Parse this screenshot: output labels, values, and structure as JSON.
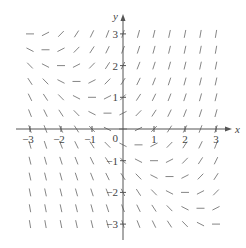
{
  "figure": {
    "type": "slope-field",
    "equation_hint": "dy/dx = x + y",
    "x_axis_label": "x",
    "y_axis_label": "y",
    "x_ticks": [
      -3,
      -2,
      -1,
      1,
      2,
      3
    ],
    "y_ticks": [
      3,
      2,
      1,
      -1,
      -2,
      -3
    ],
    "origin_label": "0",
    "x_range": [
      -3,
      3
    ],
    "y_range": [
      -3,
      3
    ],
    "grid_step": 0.5,
    "colors": {
      "axis": "#555555",
      "segments": "#777777",
      "labels": "#444444"
    }
  },
  "layout": {
    "origin_px": [
      123,
      129
    ],
    "unit_x_px": 31,
    "unit_y_px": 31.7,
    "segment_len_px": 8
  }
}
